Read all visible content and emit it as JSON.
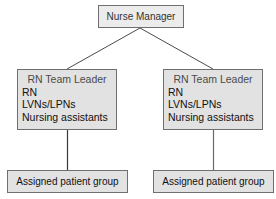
{
  "diagram": {
    "type": "org-chart",
    "root": {
      "label": "Nurse Manager"
    },
    "teams": [
      {
        "leader": "RN Team Leader",
        "members": [
          "RN",
          "LVNs/LPNs",
          "Nursing assistants"
        ],
        "group": "Assigned patient group"
      },
      {
        "leader": "RN Team Leader",
        "members": [
          "RN",
          "LVNs/LPNs",
          "Nursing assistants"
        ],
        "group": "Assigned patient group"
      }
    ],
    "colors": {
      "box_fill": "#e2e2e2",
      "box_border": "#6f6f6f",
      "line": "#4a4a4a"
    }
  }
}
